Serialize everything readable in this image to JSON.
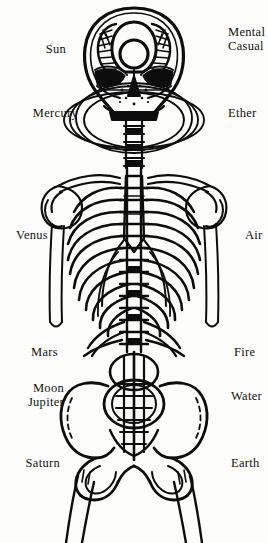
{
  "figure": {
    "background_color": "#fdfdfc",
    "ink_color": "#0d0d0d"
  },
  "labels": {
    "left": [
      {
        "name": "sun",
        "lines": [
          "Sun"
        ],
        "x": 66,
        "y": 48
      },
      {
        "name": "mercury",
        "lines": [
          "Mercury"
        ],
        "x": 78,
        "y": 112
      },
      {
        "name": "venus",
        "lines": [
          "Venus"
        ],
        "x": 48,
        "y": 234
      },
      {
        "name": "mars",
        "lines": [
          "Mars"
        ],
        "x": 58,
        "y": 351
      },
      {
        "name": "moon-jupiter",
        "lines": [
          "Moon",
          "Jupiter"
        ],
        "x": 64,
        "y": 387
      },
      {
        "name": "saturn",
        "lines": [
          "Saturn"
        ],
        "x": 60,
        "y": 462
      }
    ],
    "right": [
      {
        "name": "mental-casual",
        "lines": [
          "Mental",
          "Casual"
        ],
        "x": 228,
        "y": 29
      },
      {
        "name": "ether",
        "lines": [
          "Ether"
        ],
        "x": 228,
        "y": 111
      },
      {
        "name": "air",
        "lines": [
          "Air"
        ],
        "x": 245,
        "y": 234
      },
      {
        "name": "fire",
        "lines": [
          "Fire"
        ],
        "x": 234,
        "y": 351
      },
      {
        "name": "water",
        "lines": [
          "Water"
        ],
        "x": 232,
        "y": 394
      },
      {
        "name": "earth",
        "lines": [
          "Earth"
        ],
        "x": 232,
        "y": 462
      }
    ]
  },
  "anatomy_parts": [
    "skull",
    "clavicles",
    "scapulae",
    "humerus-left",
    "humerus-right",
    "sternum",
    "ribcage",
    "spine",
    "pelvis",
    "sacrum",
    "femur-left",
    "femur-right",
    "aura-loops"
  ]
}
